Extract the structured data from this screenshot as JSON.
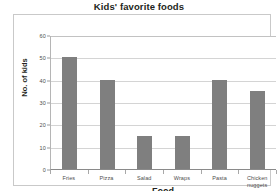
{
  "chart_data": {
    "type": "bar",
    "title": "Kids' favorite foods",
    "xlabel": "Food",
    "ylabel": "No. of kids",
    "categories": [
      "Fries",
      "Pizza",
      "Salad",
      "Wraps",
      "Pasta",
      "Chicken nuggets"
    ],
    "values": [
      50,
      40,
      15,
      15,
      40,
      35
    ],
    "ylim": [
      0,
      60
    ],
    "ytick_step": 10,
    "yticks": [
      "0",
      "10",
      "20",
      "30",
      "40",
      "50",
      "60"
    ],
    "grid": true,
    "legend": "none",
    "colors": {
      "bar": "#7f7f7f",
      "gridline": "#d4d4d4",
      "axis": "#8a8a8a",
      "frame": "#c9c9c9",
      "text": "#231f20",
      "tick_text": "#4d4d4d",
      "background": "#ffffff"
    }
  }
}
